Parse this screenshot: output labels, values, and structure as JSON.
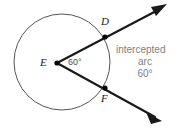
{
  "figure": {
    "type": "geometry-diagram",
    "colors": {
      "background": "#ffffff",
      "circle_stroke": "#555555",
      "ray_stroke": "#1a1a1a",
      "point_fill": "#000000",
      "point_label": "#1a1a1a",
      "angle_label": "#4d4d4d",
      "annotation_text": "#808080"
    },
    "circle": {
      "name": "circle-E",
      "center_label": "E",
      "cx": 62,
      "cy": 62,
      "r": 48,
      "stroke_width": 1
    },
    "points": [
      {
        "id": "E",
        "label": "E",
        "x": 57,
        "y": 63,
        "role": "center-vertex",
        "dot": true
      },
      {
        "id": "D",
        "label": "D",
        "x": 105,
        "y": 37,
        "role": "arc-endpoint",
        "dot": true
      },
      {
        "id": "F",
        "label": "F",
        "x": 105,
        "y": 88,
        "role": "arc-endpoint",
        "dot": true
      }
    ],
    "rays": [
      {
        "id": "ray-ED",
        "from": "E",
        "through": "D",
        "tip_x": 166,
        "tip_y": 5,
        "arrow": true
      },
      {
        "id": "ray-EF",
        "from": "E",
        "through": "F",
        "tip_x": 161,
        "tip_y": 121,
        "arrow": true
      }
    ],
    "angle": {
      "vertex": "E",
      "value": "60",
      "unit": "°",
      "label": "60°"
    },
    "annotation": {
      "line1": "intercepted",
      "line2": "arc",
      "line3": "60°"
    }
  }
}
